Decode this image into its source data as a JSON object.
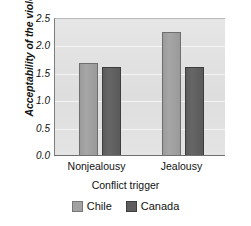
{
  "chart_data": {
    "type": "bar",
    "title": "",
    "xlabel": "Conflict trigger",
    "ylabel": "Acceptability of the violence",
    "categories": [
      "Nonjealousy",
      "Jealousy"
    ],
    "series": [
      {
        "name": "Chile",
        "values": [
          1.7,
          2.26
        ],
        "color": "#a2a2a2"
      },
      {
        "name": "Canada",
        "values": [
          1.62,
          1.62
        ],
        "color": "#5e5e5e"
      }
    ],
    "ylim": [
      0.0,
      2.5
    ],
    "yticks": [
      0.0,
      0.5,
      1.0,
      1.5,
      2.0,
      2.5
    ],
    "ytick_labels": [
      "0.0",
      "0.5",
      "1.0",
      "1.5",
      "2.0",
      "2.5"
    ],
    "grid": true,
    "legend_position": "bottom",
    "plot_background": "#e2e2e2"
  },
  "axes": {
    "y_title": "Acceptability of the violence",
    "x_title": "Conflict trigger",
    "y_tick_0": "0.0",
    "y_tick_1": "0.5",
    "y_tick_2": "1.0",
    "y_tick_3": "1.5",
    "y_tick_4": "2.0",
    "y_tick_5": "2.5"
  },
  "categories": {
    "cat_0": "Nonjealousy",
    "cat_1": "Jealousy"
  },
  "legend": {
    "items": [
      {
        "label": "Chile"
      },
      {
        "label": "Canada"
      }
    ]
  }
}
